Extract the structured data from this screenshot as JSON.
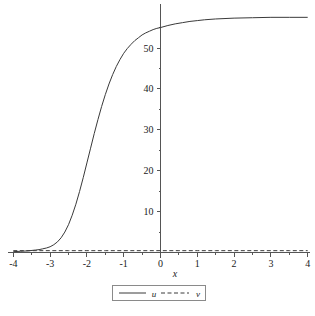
{
  "chart_data": {
    "type": "line",
    "title": "",
    "xlabel": "x",
    "ylabel": "",
    "xlim": [
      -4,
      4
    ],
    "ylim": [
      -1.5,
      60
    ],
    "grid": false,
    "legend_position": "bottom-center",
    "x_ticks": [
      "-4",
      "-3",
      "-2",
      "-1",
      "0",
      "1",
      "2",
      "3",
      "4"
    ],
    "x_tick_values": [
      -4,
      -3,
      -2,
      -1,
      0,
      1,
      2,
      3,
      4
    ],
    "y_ticks": [
      "10",
      "20",
      "30",
      "40",
      "50"
    ],
    "y_tick_values": [
      10,
      20,
      30,
      40,
      50
    ],
    "series": [
      {
        "name": "u",
        "style": "solid",
        "color": "#3a3a3a",
        "x": [
          -4.0,
          -3.8,
          -3.6,
          -3.4,
          -3.3,
          -3.2,
          -3.1,
          -3.0,
          -2.9,
          -2.8,
          -2.7,
          -2.6,
          -2.5,
          -2.4,
          -2.3,
          -2.2,
          -2.1,
          -2.0,
          -1.9,
          -1.8,
          -1.7,
          -1.6,
          -1.5,
          -1.4,
          -1.3,
          -1.2,
          -1.1,
          -1.0,
          -0.9,
          -0.8,
          -0.7,
          -0.6,
          -0.5,
          -0.4,
          -0.3,
          -0.2,
          -0.1,
          0.0,
          0.2,
          0.4,
          0.6,
          0.8,
          1.0,
          1.2,
          1.5,
          2.0,
          2.5,
          3.0,
          3.5,
          4.0
        ],
        "y": [
          0.2,
          0.3,
          0.4,
          0.6,
          0.7,
          0.9,
          1.1,
          1.4,
          1.9,
          2.6,
          3.6,
          5.0,
          6.8,
          9.1,
          11.8,
          14.9,
          18.3,
          21.9,
          25.5,
          29.1,
          32.5,
          35.7,
          38.6,
          41.2,
          43.5,
          45.5,
          47.2,
          48.7,
          49.9,
          50.9,
          51.8,
          52.5,
          53.2,
          53.7,
          54.1,
          54.5,
          54.8,
          55.0,
          55.5,
          55.9,
          56.2,
          56.5,
          56.7,
          56.9,
          57.1,
          57.3,
          57.4,
          57.5,
          57.5,
          57.5
        ]
      },
      {
        "name": "v",
        "style": "dashed",
        "color": "#3a3a3a",
        "x": [
          -4.0,
          -3.5,
          -3.0,
          -2.5,
          -2.0,
          -1.5,
          -1.0,
          -0.5,
          0.0,
          0.5,
          1.0,
          1.5,
          2.0,
          2.5,
          3.0,
          3.5,
          4.0
        ],
        "y": [
          0.45,
          0.45,
          0.45,
          0.45,
          0.45,
          0.45,
          0.45,
          0.45,
          0.45,
          0.45,
          0.45,
          0.45,
          0.45,
          0.45,
          0.45,
          0.45,
          0.45
        ]
      }
    ],
    "legend": [
      {
        "label": "u",
        "style": "solid"
      },
      {
        "label": "v",
        "style": "dashed"
      }
    ]
  },
  "axis": {
    "x_label": "x"
  },
  "legend": {
    "entry_u": "u",
    "entry_v": "v"
  },
  "colors": {
    "curve": "#3a3a3a",
    "axis": "#555555",
    "text": "#1a1a1a",
    "legend_border": "#8a8a8a",
    "background": "#ffffff"
  }
}
